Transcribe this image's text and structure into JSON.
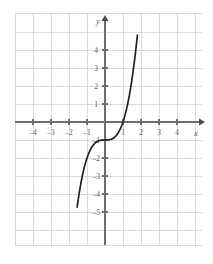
{
  "chart_data": {
    "type": "line",
    "title": "",
    "subtitle": "",
    "xlabel": "x",
    "ylabel": "y",
    "function": "y = x^3 - 1",
    "xlim": [
      -5,
      5
    ],
    "ylim": [
      -6,
      5
    ],
    "grid": true,
    "grid_step": 1,
    "legend": "none",
    "x_ticks": [
      -4,
      -3,
      -2,
      -1,
      1,
      2,
      3,
      4
    ],
    "x_tick_labels": [
      "–4",
      "–3",
      "–2",
      "–1",
      "1",
      "2",
      "3",
      "4"
    ],
    "y_ticks": [
      4,
      3,
      2,
      1,
      -1,
      -2,
      -3,
      -4,
      -5
    ],
    "y_tick_labels": [
      "4",
      "3",
      "2",
      "1",
      "–1",
      "–2",
      "–3",
      "–4",
      "–5"
    ],
    "series": [
      {
        "name": "y = x^3 - 1",
        "x": [
          -1.55,
          -1.45,
          -1.35,
          -1.25,
          -1.15,
          -1.05,
          -0.95,
          -0.85,
          -0.75,
          -0.65,
          -0.55,
          -0.45,
          -0.35,
          -0.25,
          -0.15,
          -0.05,
          0.05,
          0.15,
          0.25,
          0.35,
          0.45,
          0.55,
          0.65,
          0.75,
          0.85,
          0.95,
          1.05,
          1.15,
          1.25,
          1.35,
          1.45,
          1.55,
          1.65,
          1.75,
          1.8
        ],
        "y": [
          -4.724,
          -4.049,
          -3.46,
          -2.953,
          -2.521,
          -2.158,
          -1.857,
          -1.614,
          -1.422,
          -1.275,
          -1.166,
          -1.091,
          -1.043,
          -1.016,
          -1.003,
          -1.0,
          -1.0,
          -0.997,
          -0.984,
          -0.957,
          -0.909,
          -0.834,
          -0.725,
          -0.578,
          -0.386,
          -0.143,
          0.158,
          0.521,
          0.953,
          1.46,
          2.049,
          2.724,
          3.492,
          4.359,
          4.832
        ]
      }
    ],
    "x_intercept": 1,
    "y_intercept": -1,
    "inflection_point": [
      0,
      -1
    ],
    "colors": {
      "curve": "#231f20",
      "axis": "#6d6e71",
      "grid": "#c9cacc",
      "label": "#58585a",
      "background": "#ffffff"
    }
  },
  "axis_markers": {
    "x_axis_name": "x",
    "y_axis_name": "y"
  }
}
